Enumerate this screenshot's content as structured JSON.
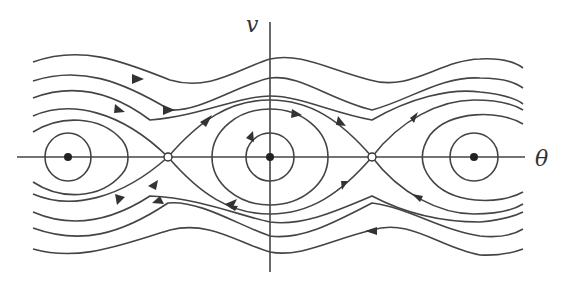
{
  "diagram": {
    "type": "phase-portrait",
    "axes": {
      "x_label": "θ",
      "y_label": "v"
    },
    "fixed_points": {
      "centers": [
        {
          "name": "center-left",
          "x": 68,
          "y": 157
        },
        {
          "name": "center-middle",
          "x": 270,
          "y": 157
        },
        {
          "name": "center-right",
          "x": 474,
          "y": 157
        }
      ],
      "saddles": [
        {
          "name": "saddle-left",
          "x": 168,
          "y": 157
        },
        {
          "name": "saddle-right",
          "x": 372,
          "y": 157
        }
      ]
    },
    "colors": {
      "stroke": "#333333",
      "background": "#ffffff"
    }
  }
}
